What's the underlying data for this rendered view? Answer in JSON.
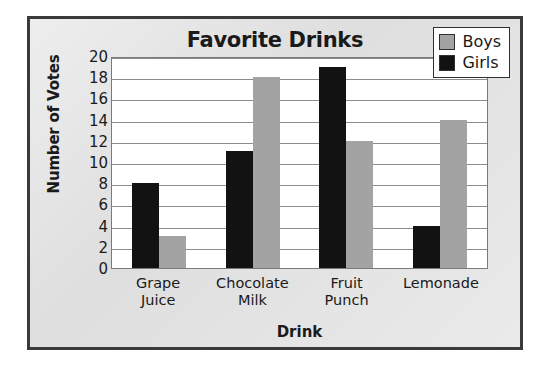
{
  "chart_data": {
    "type": "bar",
    "title": "Favorite Drinks",
    "xlabel": "Drink",
    "ylabel": "Number of Votes",
    "categories": [
      "Grape\nJuice",
      "Chocolate\nMilk",
      "Fruit\nPunch",
      "Lemonade"
    ],
    "series": [
      {
        "name": "Girls",
        "color": "#121212",
        "values": [
          8,
          11,
          19,
          4
        ]
      },
      {
        "name": "Boys",
        "color": "#a3a3a3",
        "values": [
          3,
          18,
          12,
          14
        ]
      }
    ],
    "ylim": [
      0,
      20
    ],
    "ytick_step": 2,
    "yticks": [
      20,
      18,
      16,
      14,
      12,
      10,
      8,
      6,
      4,
      2,
      0
    ],
    "grid": true,
    "legend_position": "top-right",
    "bar_order": [
      "Girls",
      "Boys"
    ]
  },
  "legend": {
    "items": [
      {
        "label": "Boys",
        "color": "#a3a3a3"
      },
      {
        "label": "Girls",
        "color": "#121212"
      }
    ]
  },
  "frame": {
    "border_color": "#3a3a3a",
    "background_color": "#d9d9d9"
  }
}
